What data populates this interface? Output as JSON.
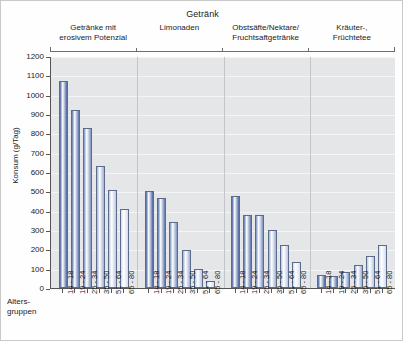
{
  "header": {
    "title": "Getränk",
    "age_axis_label": "Alters-\ngruppen"
  },
  "chart_data": {
    "type": "bar",
    "title": "Getränk",
    "xlabel": "Altersgruppen",
    "ylabel": "Konsum (g/Tag)",
    "ylim": [
      0,
      1200
    ],
    "ytick_step": 100,
    "yticks": [
      0,
      100,
      200,
      300,
      400,
      500,
      600,
      700,
      800,
      900,
      1000,
      1100,
      1200
    ],
    "ytick_labels": [
      "0",
      "100",
      "200",
      "300",
      "400",
      "500",
      "600",
      "700",
      "800",
      "900",
      "1000",
      "1100",
      "1200"
    ],
    "grid": true,
    "legend": "none",
    "categories": [
      "14 - 18",
      "19 - 24",
      "25 - 34",
      "35 - 50",
      "51 - 64",
      "65 - 80"
    ],
    "groups": [
      {
        "label": "Getränke mit\nerosivem Potenzial",
        "values": [
          1070,
          920,
          830,
          630,
          505,
          410
        ]
      },
      {
        "label": "Limonaden",
        "values": [
          500,
          465,
          340,
          197,
          100,
          35
        ]
      },
      {
        "label": "Obstsäfte/Nektare/\nFruchtsaftgetränke",
        "values": [
          478,
          380,
          378,
          300,
          222,
          132
        ]
      },
      {
        "label": "Kräuter-,\nFrüchtetee",
        "values": [
          65,
          60,
          85,
          120,
          165,
          222
        ]
      }
    ],
    "bar_colors": [
      "#4a63a0",
      "#5c75ad",
      "#7e93c2",
      "#9fb0d2",
      "#bcc8e0",
      "#d4dcec"
    ],
    "plot_background": "#e4e6e8",
    "gridline_color": "#f4f5f6",
    "axis_color": "#555555"
  }
}
